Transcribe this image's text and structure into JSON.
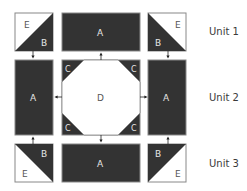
{
  "diagram": {
    "type": "quilt-block-assembly",
    "colors": {
      "dark": "#333333",
      "light": "#ffffff",
      "outline": "#888888",
      "label_on_dark": "#e6e6e6",
      "label_on_light": "#555555",
      "arrow": "#222222"
    },
    "units": [
      {
        "label": "Unit 1",
        "pieces": [
          {
            "position": "left",
            "type": "half-square-triangle",
            "light": "E",
            "dark": "B",
            "dark_corner": "bottom-right"
          },
          {
            "position": "center",
            "type": "rectangle",
            "label": "A"
          },
          {
            "position": "right",
            "type": "half-square-triangle",
            "light": "E",
            "dark": "B",
            "dark_corner": "bottom-left"
          }
        ]
      },
      {
        "label": "Unit 2",
        "pieces": [
          {
            "position": "left",
            "type": "rectangle",
            "label": "A"
          },
          {
            "position": "center",
            "type": "octagon-square",
            "center_label": "D",
            "corner_labels": [
              "C",
              "C",
              "C",
              "C"
            ]
          },
          {
            "position": "right",
            "type": "rectangle",
            "label": "A"
          }
        ]
      },
      {
        "label": "Unit 3",
        "pieces": [
          {
            "position": "left",
            "type": "half-square-triangle",
            "light": "E",
            "dark": "B",
            "dark_corner": "top-right"
          },
          {
            "position": "center",
            "type": "rectangle",
            "label": "A"
          },
          {
            "position": "right",
            "type": "half-square-triangle",
            "light": "E",
            "dark": "B",
            "dark_corner": "top-left"
          }
        ]
      }
    ],
    "labels": {
      "a": "A",
      "b": "B",
      "c": "C",
      "d": "D",
      "e": "E",
      "unit1": "Unit 1",
      "unit2": "Unit 2",
      "unit3": "Unit 3"
    },
    "arrows": [
      {
        "from": "unit1-left",
        "to": "unit2-left",
        "direction": "down"
      },
      {
        "from": "unit2-center",
        "to": "unit1-center",
        "direction": "up"
      },
      {
        "from": "unit1-right",
        "to": "unit2-right",
        "direction": "down"
      },
      {
        "from": "unit2-center",
        "to": "unit2-left",
        "direction": "left"
      },
      {
        "from": "unit2-center",
        "to": "unit2-right",
        "direction": "right"
      },
      {
        "from": "unit3-left",
        "to": "unit2-left",
        "direction": "up"
      },
      {
        "from": "unit2-center",
        "to": "unit3-center",
        "direction": "down"
      },
      {
        "from": "unit3-right",
        "to": "unit2-right",
        "direction": "up"
      }
    ]
  }
}
